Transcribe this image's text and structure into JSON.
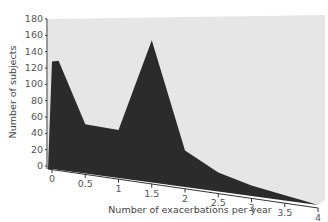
{
  "chart_data": {
    "type": "area",
    "style": "3d-area",
    "title": "",
    "xlabel": "Number of exacerbations per year",
    "ylabel": "Number of subjects",
    "x": [
      0,
      0.1,
      0.5,
      1.0,
      1.5,
      2.0,
      2.5,
      3.0,
      3.5,
      3.75,
      4.0
    ],
    "series": [
      {
        "name": "Subjects",
        "values": [
          128,
          130,
          57,
          56,
          172,
          43,
          22,
          12,
          6,
          3,
          0
        ]
      }
    ],
    "xticks": [
      "0",
      "0.5",
      "1",
      "1.5",
      "2",
      "2.5",
      "3",
      "3.5",
      "4"
    ],
    "yticks": [
      "0",
      "20",
      "40",
      "60",
      "80",
      "100",
      "120",
      "140",
      "160",
      "180"
    ],
    "xlim": [
      0,
      4
    ],
    "ylim": [
      0,
      180
    ],
    "grid": false,
    "legend": "none",
    "colors": {
      "area": "#2b2b2b",
      "wall": "#e6e6e6",
      "axis": "#333333"
    }
  }
}
